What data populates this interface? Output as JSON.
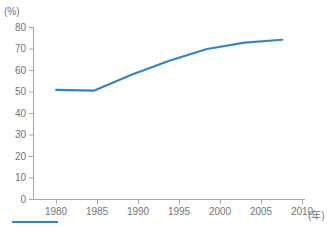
{
  "chart_data": {
    "type": "line",
    "title": "",
    "subtitle": "",
    "xlabel": "(年)",
    "ylabel": "(%)",
    "x": [
      1980,
      1985,
      1990,
      1995,
      2000,
      2005,
      2010
    ],
    "categories": [
      "1980",
      "1985",
      "1990",
      "1995",
      "2000",
      "2005",
      "2010"
    ],
    "series": [
      {
        "name": "割合",
        "color": "#2e86ce",
        "values": [
          51.0,
          50.6,
          58.0,
          64.5,
          70.0,
          73.0,
          74.3
        ]
      }
    ],
    "xlim": [
      1977,
      2013
    ],
    "ylim": [
      0,
      80
    ],
    "xticks": [
      "1980",
      "1985",
      "1990",
      "1995",
      "2000",
      "2005",
      "2010"
    ],
    "yticks": [
      "0",
      "10",
      "20",
      "30",
      "40",
      "50",
      "60",
      "70",
      "80"
    ],
    "grid": false,
    "legend_position": "bottom-left",
    "annotations": []
  },
  "axes": {
    "y_unit_label": "(%)",
    "x_unit_label": "(年)",
    "y_tick_labels": [
      "80",
      "70",
      "60",
      "50",
      "40",
      "30",
      "20",
      "10",
      "0"
    ],
    "x_tick_labels": [
      "1980",
      "1985",
      "1990",
      "1995",
      "2000",
      "2005",
      "2010"
    ],
    "axis_color": "#a8a8a8",
    "tick_color": "#a8a8a8",
    "label_color": "#757575"
  },
  "legend": {
    "swatch_color": "#2e86ce",
    "text": ""
  },
  "colors": {
    "line": "#2e86ce",
    "background": "#ffffff"
  }
}
